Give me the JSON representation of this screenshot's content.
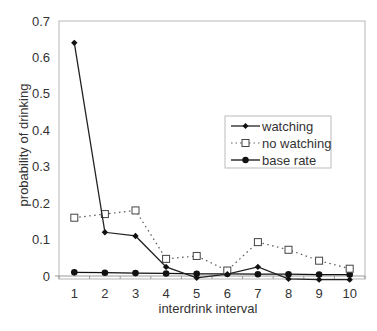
{
  "chart_data": {
    "type": "line",
    "title": "",
    "xlabel": "interdrink interval",
    "ylabel": "probability of drinking",
    "categories": [
      "1",
      "2",
      "3",
      "4",
      "5",
      "6",
      "7",
      "8",
      "9",
      "10"
    ],
    "ylim": [
      0,
      0.7
    ],
    "yticks": [
      0,
      0.1,
      0.2,
      0.3,
      0.4,
      0.5,
      0.6,
      0.7
    ],
    "ytick_labels": [
      "0",
      "0.1",
      "0.2",
      "0.3",
      "0.4",
      "0.5",
      "0.6",
      "0.7"
    ],
    "grid": false,
    "legend_position": "inside-right-middle",
    "series": [
      {
        "name": "watching",
        "marker": "diamond",
        "line": "solid",
        "color": "#222222",
        "values": [
          0.64,
          0.12,
          0.11,
          0.025,
          -0.005,
          0.005,
          0.025,
          -0.008,
          -0.01,
          -0.01
        ]
      },
      {
        "name": "no watching",
        "marker": "open-square",
        "line": "dotted",
        "color": "#555555",
        "values": [
          0.16,
          0.17,
          0.18,
          0.047,
          0.055,
          0.015,
          0.093,
          0.072,
          0.042,
          0.02
        ]
      },
      {
        "name": "base rate",
        "marker": "filled-circle",
        "line": "solid",
        "color": "#111111",
        "values": [
          0.01,
          0.009,
          0.008,
          0.007,
          0.006,
          0.006,
          0.005,
          0.005,
          0.004,
          0.004
        ]
      }
    ]
  },
  "legend": {
    "items": [
      {
        "label": "watching"
      },
      {
        "label": "no watching"
      },
      {
        "label": "base rate"
      }
    ]
  }
}
